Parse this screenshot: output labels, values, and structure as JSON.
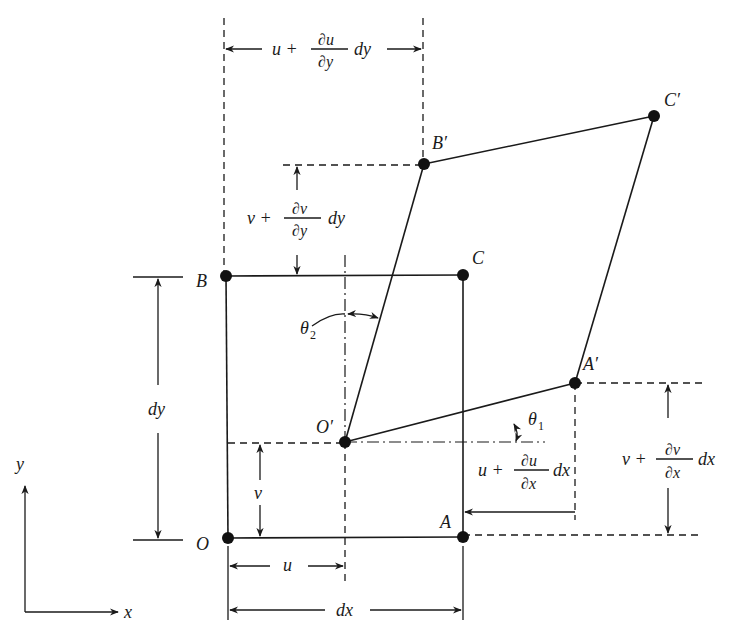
{
  "figure": {
    "type": "strain-deformation-element",
    "points": {
      "O": {
        "label": "O",
        "x": 228,
        "y": 538
      },
      "A": {
        "label": "A",
        "x": 463,
        "y": 537
      },
      "B": {
        "label": "B",
        "x": 226,
        "y": 276
      },
      "C": {
        "label": "C",
        "x": 463,
        "y": 275
      },
      "O_prime": {
        "label": "O′",
        "x": 345,
        "y": 442
      },
      "A_prime": {
        "label": "A′",
        "x": 575,
        "y": 383
      },
      "B_prime": {
        "label": "B′",
        "x": 424,
        "y": 164
      },
      "C_prime": {
        "label": "C′",
        "x": 654,
        "y": 116
      }
    },
    "axes": {
      "x_label": "x",
      "y_label": "y"
    },
    "dimensions": {
      "dx": "dx",
      "dy": "dy",
      "u": "u",
      "v": "v",
      "u_plus_dudy": {
        "lead": "u +",
        "num": "∂u",
        "den": "∂y",
        "tail": "dy"
      },
      "v_plus_dvdy": {
        "lead": "v +",
        "num": "∂v",
        "den": "∂y",
        "tail": "dy"
      },
      "u_plus_dudx": {
        "lead": "u +",
        "num": "∂u",
        "den": "∂x",
        "tail": "dx"
      },
      "v_plus_dvdx": {
        "lead": "v +",
        "num": "∂v",
        "den": "∂x",
        "tail": "dx"
      }
    },
    "angles": {
      "theta1": {
        "sym": "θ",
        "sub": "1"
      },
      "theta2": {
        "sym": "θ",
        "sub": "2"
      }
    },
    "colors": {
      "ink": "#1a1a1a",
      "background": "#ffffff"
    }
  }
}
